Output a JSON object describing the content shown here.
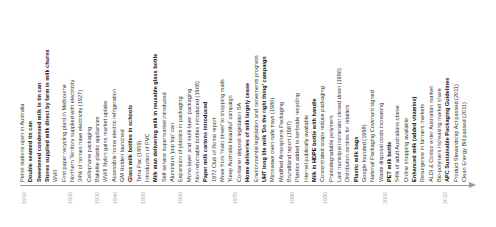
{
  "timeline": {
    "axis_color": "#9a9a9a",
    "ticks": [
      {
        "label": "1910",
        "x": 21
      },
      {
        "label": "1920",
        "x": 67
      },
      {
        "label": "1930",
        "x": 94
      },
      {
        "label": "1940",
        "x": 112
      },
      {
        "label": "1950",
        "x": 140
      },
      {
        "label": "1960",
        "x": 177
      },
      {
        "label": "1970",
        "x": 232
      },
      {
        "label": "1980",
        "x": 289
      },
      {
        "label": "1990",
        "x": 322
      },
      {
        "label": "2000",
        "x": 382
      },
      {
        "label": "2010",
        "x": 442
      }
    ],
    "events": [
      {
        "text": "Petrol stations open in Australia",
        "bold": false
      },
      {
        "text": "Double seamed tin can",
        "bold": true
      },
      {
        "text": "Sweetened condensed milk in tin can",
        "bold": true
      },
      {
        "text": "Stores supplied milk direct by farm in milk churns",
        "bold": true
      },
      {
        "text": "WWI",
        "bold": false
      },
      {
        "text": "First paper recycling plant in Melbourne",
        "bold": false
      },
      {
        "text": "Northern Territory supplied with electricity",
        "bold": false
      },
      {
        "text": "34% of homes have electricity (1927)",
        "bold": false
      },
      {
        "text": "Cellophane packaging",
        "bold": false
      },
      {
        "text": "Bakelite plastic appliances",
        "bold": false
      },
      {
        "text": "WWII Nylon gains market uptake",
        "bold": false
      },
      {
        "text": "Accessible home electric refrigeration",
        "bold": false
      },
      {
        "text": "GM Holden launched",
        "bold": false
      },
      {
        "text": "Glass milk bottles in schools",
        "bold": true
      },
      {
        "text": "Tetra Pac (1959)",
        "bold": false
      },
      {
        "text": "Introduction of PVC",
        "bold": false
      },
      {
        "text": "Milk man delivering milk in reusable glass bottle",
        "bold": true
      },
      {
        "text": "Self-service supermarket introduced",
        "bold": false
      },
      {
        "text": "Aluminium 'pop top' can",
        "bold": false
      },
      {
        "text": "Expansion of plastics in packaging",
        "bold": false
      },
      {
        "text": "Mono-layer and multi-layer packaging",
        "bold": false
      },
      {
        "text": "Non-returnable bottles introduced (1968)",
        "bold": false
      },
      {
        "text": "Paper milk cartons introduced",
        "bold": true
      },
      {
        "text": "1972 Club of Rome report",
        "bold": false
      },
      {
        "text": "Move from 'main street' to shopping malls",
        "bold": false
      },
      {
        "text": "'Keep Australia beautiful' campaign",
        "bold": false
      },
      {
        "text": "Container deposit legislation SA",
        "bold": false
      },
      {
        "text": "Home deliveries of milk largely cease",
        "bold": true
      },
      {
        "text": "Environmental legislation and movements progress",
        "bold": false
      },
      {
        "text": "UHT long life milk 'Do the right thing' campaign",
        "bold": true
      },
      {
        "text": "Microwave oven-safe trays (1986)",
        "bold": false
      },
      {
        "text": "Modified Atmosphere Packaging",
        "bold": false
      },
      {
        "text": "Brundtland report (1987)",
        "bold": false
      },
      {
        "text": "Plastics added to kerbside recycling",
        "bold": false
      },
      {
        "text": "Internet publically available",
        "bold": false
      },
      {
        "text": "Milk in HDPE bottle with handle",
        "bold": true
      },
      {
        "text": "Concentrated soaps reduce packaging",
        "bold": false
      },
      {
        "text": "Photodegradable polymers",
        "bold": false
      },
      {
        "text": "Last municipal incinerator closed down (1996)",
        "bold": false
      },
      {
        "text": "Distribution centres for retailers",
        "bold": false
      },
      {
        "text": "Plastic milk bags",
        "bold": true
      },
      {
        "text": "Google founded (1998)",
        "bold": false
      },
      {
        "text": "National Packaging Covenant signed",
        "bold": false
      },
      {
        "text": "Waste disposal costs increasing",
        "bold": false
      },
      {
        "text": "PET milk bottle",
        "bold": true
      },
      {
        "text": "54% of adult Australians obese",
        "bold": false
      },
      {
        "text": "Online shopping available",
        "bold": false
      },
      {
        "text": "Enhanced milk (added vitamins)",
        "bold": true
      },
      {
        "text": "Resurgence in farmers markets",
        "bold": false
      },
      {
        "text": "ALDI & Costco enter Australian market",
        "bold": false
      },
      {
        "text": "Bio-polymers increasing market share",
        "bold": false
      },
      {
        "text": "APC Sustainable Packaging Guidelines",
        "bold": true
      },
      {
        "text": "Product Stewardship Act passed (2011)",
        "bold": false
      },
      {
        "text": "Clean Energy Bill passed (2011)",
        "bold": false
      }
    ]
  }
}
